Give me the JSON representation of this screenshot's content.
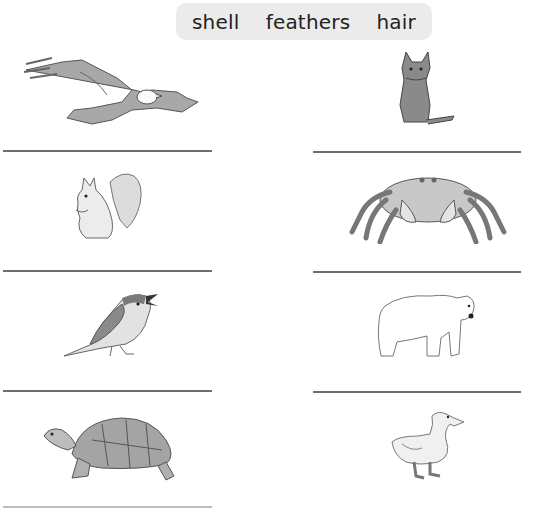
{
  "word_bank": {
    "words": [
      "shell",
      "feathers",
      "hair"
    ]
  },
  "worksheet": {
    "items": [
      {
        "animal": "eagle",
        "column": "left",
        "row": 1
      },
      {
        "animal": "cat",
        "column": "right",
        "row": 1
      },
      {
        "animal": "squirrel",
        "column": "left",
        "row": 2
      },
      {
        "animal": "crab",
        "column": "right",
        "row": 2
      },
      {
        "animal": "sparrow",
        "column": "left",
        "row": 3
      },
      {
        "animal": "polar bear",
        "column": "right",
        "row": 3
      },
      {
        "animal": "tortoise",
        "column": "left",
        "row": 4
      },
      {
        "animal": "duck",
        "column": "right",
        "row": 4
      }
    ],
    "answers": [
      "",
      "",
      "",
      "",
      "",
      "",
      "",
      ""
    ]
  },
  "colors": {
    "word_bank_bg": "#ebebeb",
    "line": "#6e6e6e",
    "illustration_gray": "#9a9a9a"
  }
}
